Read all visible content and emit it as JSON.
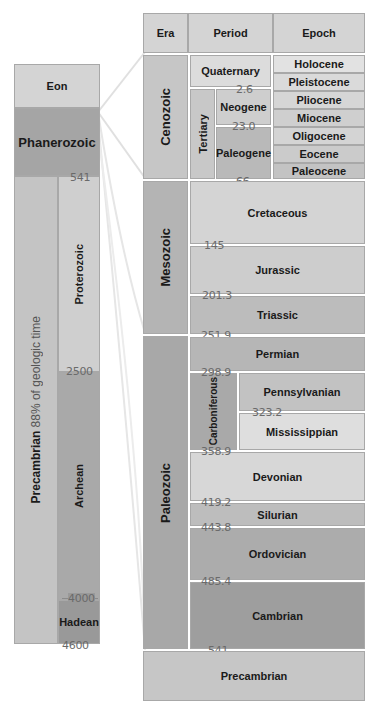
{
  "eon_panel": {
    "header": "Eon",
    "phanerozoic": "Phanerozoic",
    "precambrian": "Precambrian",
    "precambrian_note": "88% of geologic time",
    "proterozoic": "Proterozoic",
    "archean": "Archean",
    "hadean": "Hadean",
    "ages": {
      "phanerozoic_base": "541",
      "proterozoic_base": "2500",
      "archean_base": "4000",
      "hadean_base": "4600"
    }
  },
  "detail_panel": {
    "headers": {
      "era": "Era",
      "period": "Period",
      "epoch": "Epoch"
    },
    "eras": {
      "cenozoic": "Cenozoic",
      "mesozoic": "Mesozoic",
      "paleozoic": "Paleozoic"
    },
    "cenozoic": {
      "quaternary": "Quaternary",
      "tertiary": "Tertiary",
      "neogene": "Neogene",
      "paleogene": "Paleogene",
      "epochs": [
        "Holocene",
        "Pleistocene",
        "Pliocene",
        "Miocene",
        "Oligocene",
        "Eocene",
        "Paleocene"
      ],
      "ages": {
        "quaternary_base": "2.6",
        "neogene_base": "23.0",
        "paleogene_base": "66"
      }
    },
    "mesozoic": {
      "periods": [
        "Cretaceous",
        "Jurassic",
        "Triassic"
      ],
      "ages": [
        "145",
        "201.3",
        "251.9"
      ]
    },
    "paleozoic": {
      "permian": "Permian",
      "carboniferous": "Carboniferous",
      "pennsylvanian": "Pennsylvanian",
      "mississippian": "Mississippian",
      "devonian": "Devonian",
      "silurian": "Silurian",
      "ordovician": "Ordovician",
      "cambrian": "Cambrian",
      "ages": {
        "permian_base": "298.9",
        "pennsylvanian_base": "323.2",
        "carboniferous_base": "358.9",
        "devonian_base": "419.2",
        "silurian_base": "443.8",
        "ordovician_base": "485.4",
        "cambrian_base": "541"
      }
    },
    "precambrian": "Precambrian"
  },
  "colors": {
    "header_bg": "#d4d4d4",
    "phanerozoic_bg": "#a5a5a5",
    "light_bg": "#d9d9d9",
    "mid_bg": "#b8b8b8",
    "dark_bg": "#9e9e9e"
  }
}
